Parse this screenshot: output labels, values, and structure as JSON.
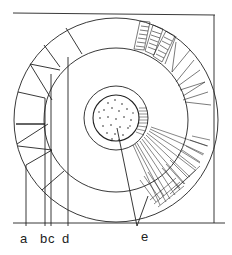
{
  "figure": {
    "colors": {
      "stroke": "#222222",
      "background": "#ffffff"
    }
  },
  "labels": [
    {
      "id": "a",
      "text": "a",
      "x": 20,
      "y": 232
    },
    {
      "id": "b",
      "text": "b",
      "x": 41,
      "y": 232
    },
    {
      "id": "c",
      "text": "c",
      "x": 50,
      "y": 232
    },
    {
      "id": "d",
      "text": "d",
      "x": 62,
      "y": 232
    },
    {
      "id": "e",
      "text": "e",
      "x": 141,
      "y": 232
    }
  ]
}
